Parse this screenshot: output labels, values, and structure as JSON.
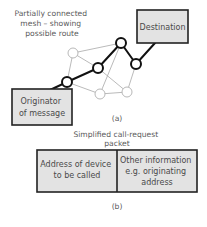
{
  "part_a": {
    "caption": "Partially connected mesh – showing possible route",
    "caption_lines": [
      "Partially connected",
      "mesh – showing",
      "possible route"
    ],
    "destination_label": "Destination",
    "originator_lines": [
      "Originator",
      "of message"
    ],
    "figure_label": "(a)",
    "nodes": [
      {
        "id": "n1",
        "x": 73,
        "y": 53,
        "on_route": false
      },
      {
        "id": "n2",
        "x": 121,
        "y": 43,
        "on_route": true
      },
      {
        "id": "n3",
        "x": 98,
        "y": 68,
        "on_route": true
      },
      {
        "id": "n4",
        "x": 67,
        "y": 82,
        "on_route": true
      },
      {
        "id": "n5",
        "x": 136,
        "y": 64,
        "on_route": true
      },
      {
        "id": "n6",
        "x": 100,
        "y": 94,
        "on_route": false
      },
      {
        "id": "n7",
        "x": 127,
        "y": 92,
        "on_route": false
      }
    ]
  },
  "part_b": {
    "title_lines": [
      "Simplified call-request",
      "packet"
    ],
    "field_1_lines": [
      "Address of device",
      "to be called"
    ],
    "field_2_lines": [
      "Other information",
      "e.g. originating",
      "address"
    ],
    "figure_label": "(b)"
  },
  "colors": {
    "box_fill": "#e3e3e3",
    "route": "#111111",
    "mesh_line": "#aaaaaa",
    "text": "#555555"
  }
}
